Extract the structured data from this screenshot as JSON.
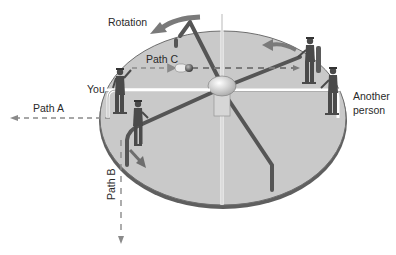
{
  "diagram": {
    "labels": {
      "rotation": "Rotation",
      "path_a": "Path A",
      "path_b": "Path B",
      "path_c": "Path C",
      "you": "You",
      "another_person_line1": "Another",
      "another_person_line2": "person"
    },
    "colors": {
      "disc_fill": "#c9c9c9",
      "disc_edge": "#6e6e6e",
      "bar": "#5a5a5a",
      "arrow": "#777777",
      "dashed_path": "#8a8a8a",
      "hub": "#e4e4e4",
      "figure": "#4a4a4a"
    },
    "elements": [
      {
        "name": "rotating-disc",
        "type": "ellipse"
      },
      {
        "name": "center-hub",
        "type": "ellipse"
      },
      {
        "name": "ball",
        "type": "sphere",
        "path": "Path C"
      },
      {
        "name": "person-you",
        "role": "You"
      },
      {
        "name": "person-another",
        "role": "Another person"
      },
      {
        "name": "person-thrower"
      },
      {
        "name": "person-rider"
      }
    ]
  }
}
